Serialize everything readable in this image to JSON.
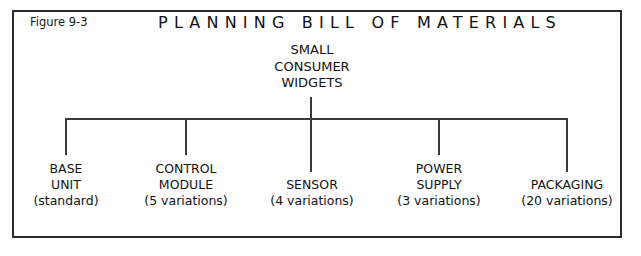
{
  "figure": {
    "number_label": "Figure 9-3",
    "title": "PLANNING BILL OF MATERIALS",
    "frame_color": "#2b2b2b",
    "line_color": "#3a3a3a",
    "text_color": "#111111",
    "background_color": "#ffffff"
  },
  "chart_data": {
    "type": "diagram",
    "diagram_type": "tree",
    "title": "PLANNING BILL OF MATERIALS",
    "root": {
      "lines": [
        "SMALL",
        "CONSUMER",
        "WIDGETS"
      ],
      "text": "SMALL CONSUMER WIDGETS"
    },
    "children": [
      {
        "lines": [
          "BASE",
          "UNIT"
        ],
        "name": "BASE UNIT",
        "qty_label": "(standard)",
        "variations": 1
      },
      {
        "lines": [
          "CONTROL",
          "MODULE"
        ],
        "name": "CONTROL MODULE",
        "qty_label": "(5 variations)",
        "variations": 5
      },
      {
        "lines": [
          "SENSOR"
        ],
        "name": "SENSOR",
        "qty_label": "(4 variations)",
        "variations": 4
      },
      {
        "lines": [
          "POWER",
          "SUPPLY"
        ],
        "name": "POWER SUPPLY",
        "qty_label": "(3 variations)",
        "variations": 3
      },
      {
        "lines": [
          "PACKAGING"
        ],
        "name": "PACKAGING",
        "qty_label": "(20 variations)",
        "variations": 20
      }
    ]
  }
}
